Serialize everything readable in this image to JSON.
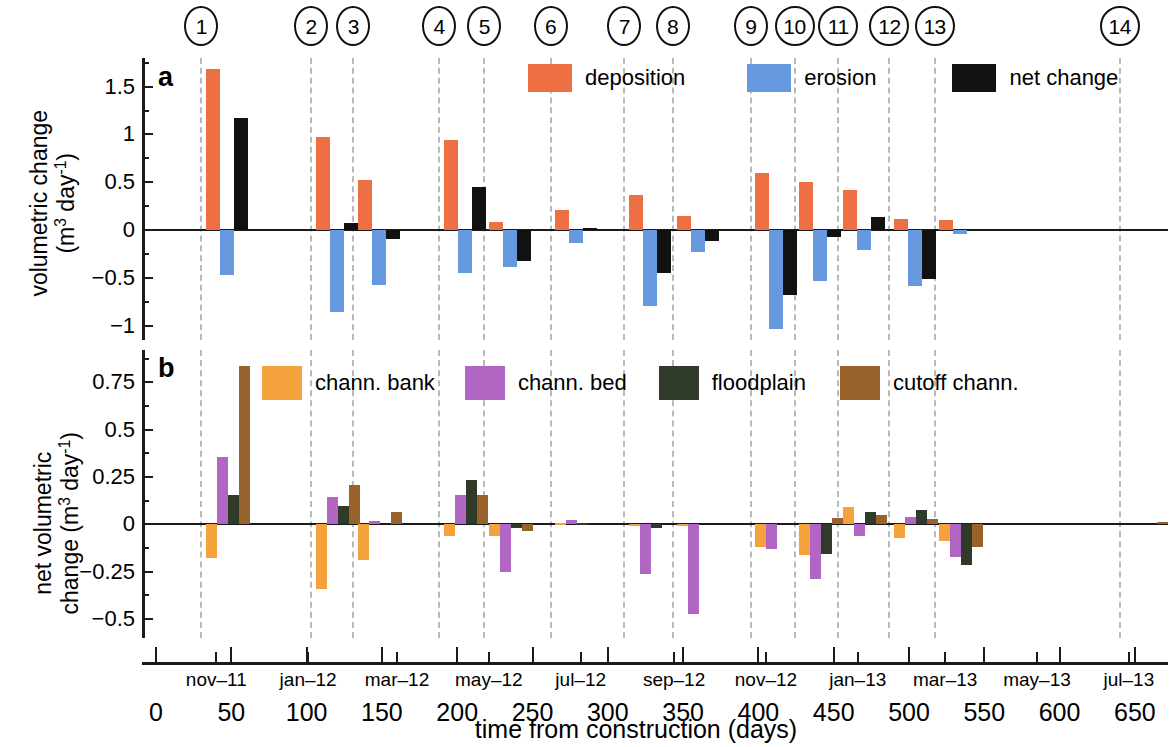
{
  "figure": {
    "callouts": [
      "1",
      "2",
      "3",
      "4",
      "5",
      "6",
      "7",
      "8",
      "9",
      "10",
      "11",
      "12",
      "13",
      "14"
    ],
    "callout_days": [
      30,
      103,
      131,
      188,
      218,
      262,
      311,
      343,
      395,
      424,
      453,
      487,
      517,
      640
    ]
  },
  "panel_a": {
    "label": "a",
    "ylabel_line1": "volumetric change",
    "ylabel_line2": "(m³ day⁻¹)",
    "legend": [
      {
        "name": "deposition",
        "color": "#ef6f45"
      },
      {
        "name": "erosion",
        "color": "#6699dd"
      },
      {
        "name": "net change",
        "color": "#111111"
      }
    ]
  },
  "panel_b": {
    "label": "b",
    "ylabel_line1": "net volumetric",
    "ylabel_line2": "change (m³ day⁻¹)",
    "legend": [
      {
        "name": "chann. bank",
        "color": "#f6a23c"
      },
      {
        "name": "chann. bed",
        "color": "#b islands"
      },
      {
        "name": "floodplain",
        "color": "#2f3b28"
      },
      {
        "name": "cutoff chann.",
        "color": "#97622c"
      }
    ]
  },
  "xaxis": {
    "title": "time from construction (days)",
    "day_ticks": [
      0,
      50,
      100,
      150,
      200,
      250,
      300,
      350,
      400,
      450,
      500,
      550,
      600,
      650
    ],
    "month_labels": [
      "nov-11",
      "jan-12",
      "mar-12",
      "may-12",
      "jul-12",
      "sep-12",
      "nov-12",
      "jan-13",
      "mar-13",
      "may-13",
      "jul-13"
    ],
    "month_days": [
      40,
      101,
      160,
      221,
      282,
      344,
      405,
      466,
      524,
      585,
      646
    ],
    "range": [
      -8,
      672
    ]
  },
  "chart_data": [
    {
      "type": "bar",
      "panel": "a",
      "title": "volumetric change",
      "xlabel": "time from construction (days)",
      "ylabel": "volumetric change (m^3 day^-1)",
      "ylim": [
        -1.15,
        1.8
      ],
      "yticks": [
        -1,
        -0.5,
        0,
        0.5,
        1,
        1.5
      ],
      "xlim": [
        -8,
        672
      ],
      "grid": "vertical dashed survey lines",
      "legend_position": "top-right-inside",
      "categories_days": [
        33,
        106,
        134,
        191,
        221,
        265,
        314,
        346,
        398,
        427,
        456,
        490,
        520,
        643
      ],
      "series": [
        {
          "name": "deposition",
          "color": "#ef6f45",
          "values": [
            1.68,
            0.97,
            0.52,
            0.94,
            0.08,
            0.21,
            0.37,
            0.15,
            0.6,
            0.5,
            0.42,
            0.12,
            0.11,
            0.0
          ]
        },
        {
          "name": "erosion",
          "color": "#6699dd",
          "values": [
            -0.47,
            -0.86,
            -0.57,
            -0.45,
            -0.39,
            -0.14,
            -0.79,
            -0.23,
            -1.03,
            -0.53,
            -0.21,
            -0.59,
            -0.04,
            0.0
          ]
        },
        {
          "name": "net change",
          "color": "#111111",
          "values": [
            1.17,
            0.07,
            -0.09,
            0.45,
            -0.32,
            0.02,
            -0.45,
            -0.11,
            -0.68,
            -0.07,
            0.14,
            -0.51,
            0.0,
            0.0
          ]
        }
      ]
    },
    {
      "type": "bar",
      "panel": "b",
      "title": "net volumetric change by unit",
      "xlabel": "time from construction (days)",
      "ylabel": "net volumetric change (m^3 day^-1)",
      "ylim": [
        -0.6,
        0.92
      ],
      "yticks": [
        -0.5,
        -0.25,
        0,
        0.25,
        0.5,
        0.75
      ],
      "xlim": [
        -8,
        672
      ],
      "grid": "vertical dashed survey lines",
      "legend_position": "top-inside",
      "categories_days": [
        33,
        106,
        134,
        191,
        221,
        265,
        314,
        346,
        398,
        427,
        456,
        490,
        520,
        643
      ],
      "series": [
        {
          "name": "chann. bank",
          "color": "#f6a23c",
          "values": [
            -0.18,
            -0.34,
            -0.19,
            -0.06,
            -0.06,
            0.005,
            -0.005,
            -0.005,
            -0.12,
            -0.16,
            0.09,
            -0.07,
            -0.09,
            0.0
          ]
        },
        {
          "name": "chann. bed",
          "color": "#b266c4",
          "values": [
            0.355,
            0.145,
            0.02,
            0.155,
            -0.25,
            0.025,
            -0.26,
            -0.475,
            -0.13,
            -0.29,
            -0.06,
            0.04,
            -0.17,
            0.0
          ]
        },
        {
          "name": "floodplain",
          "color": "#2f3b28",
          "values": [
            0.155,
            0.095,
            0.0,
            0.235,
            -0.02,
            0.005,
            -0.02,
            0.0,
            0.0,
            -0.155,
            0.065,
            0.075,
            -0.215,
            0.0
          ]
        },
        {
          "name": "cutoff chann.",
          "color": "#97622c",
          "values": [
            0.835,
            0.205,
            0.065,
            0.155,
            -0.035,
            0.0,
            0.0,
            0.0,
            0.0,
            0.035,
            0.05,
            0.03,
            -0.12,
            0.01
          ]
        }
      ]
    }
  ]
}
